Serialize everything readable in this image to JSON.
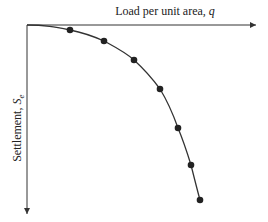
{
  "chart_data": {
    "type": "line",
    "title": "",
    "xlabel": "Load per unit area, q",
    "ylabel": "Settlement, Se",
    "x_axis": {
      "label_text": "Load per unit area, ",
      "label_var": "q",
      "direction": "right"
    },
    "y_axis": {
      "label_text": "Settlement, ",
      "label_var": "S",
      "label_sub": "e",
      "direction": "down"
    },
    "grid": false,
    "legend": null,
    "series": [
      {
        "name": "load-settlement curve",
        "points_px": [
          [
            70,
            30
          ],
          [
            104,
            41
          ],
          [
            134,
            60
          ],
          [
            160,
            89
          ],
          [
            178,
            128
          ],
          [
            191,
            165
          ],
          [
            200,
            200
          ]
        ],
        "x_relative": [
          0.25,
          0.44,
          0.61,
          0.75,
          0.85,
          0.92,
          0.97
        ],
        "y_relative": [
          0.03,
          0.09,
          0.19,
          0.35,
          0.56,
          0.76,
          0.95
        ]
      }
    ],
    "axis_ranges": {
      "x": [
        0,
        1
      ],
      "y": [
        0,
        1
      ]
    },
    "ticks": "none"
  },
  "colors": {
    "axis": "#333333",
    "curve": "#333333",
    "marker": "#222222"
  }
}
